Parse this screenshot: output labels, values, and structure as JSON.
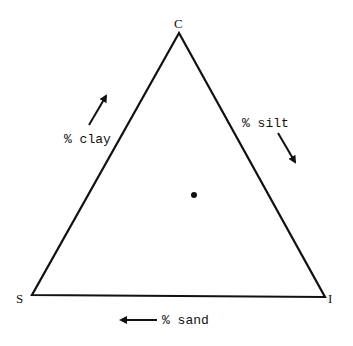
{
  "diagram": {
    "type": "ternary-triangle",
    "vertices": {
      "top": {
        "label": "C"
      },
      "bottom_left": {
        "label": "S"
      },
      "bottom_right": {
        "label": "I"
      }
    },
    "axes": {
      "left": {
        "label": "% clay",
        "arrow_direction": "up-right"
      },
      "right": {
        "label": "% silt",
        "arrow_direction": "down-right"
      },
      "bottom": {
        "label": "% sand",
        "arrow_direction": "left"
      }
    },
    "points": [
      {
        "name": "sample-point",
        "x_px": 194,
        "y_px": 195
      }
    ],
    "colors": {
      "line": "#111111",
      "background": "#ffffff"
    }
  }
}
